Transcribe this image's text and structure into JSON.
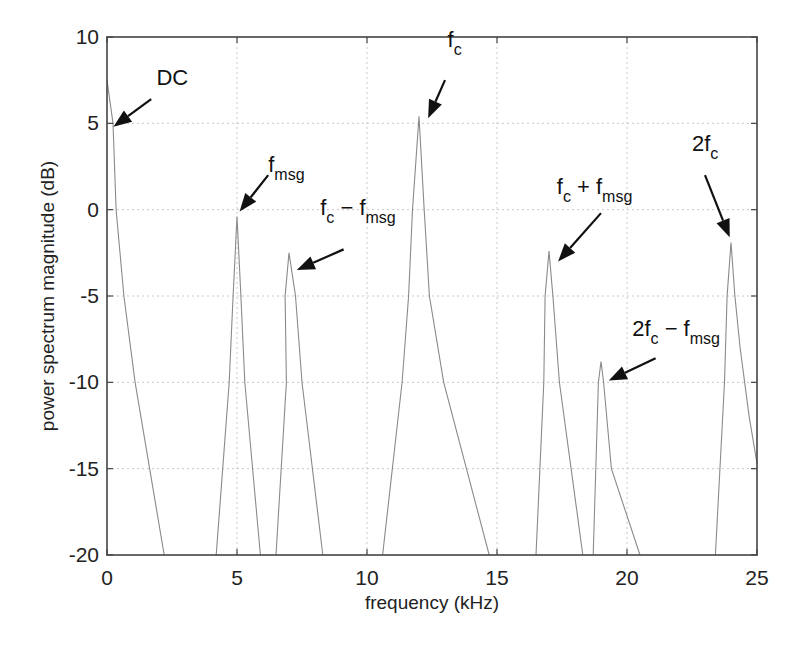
{
  "chart_data": {
    "type": "line",
    "title": "",
    "xlabel": "frequency (kHz)",
    "ylabel": "power spectrum magnitude (dB)",
    "xlim": [
      0,
      25
    ],
    "ylim": [
      -20,
      10
    ],
    "xticks": [
      0,
      5,
      10,
      15,
      20,
      25
    ],
    "yticks": [
      10,
      5,
      0,
      -5,
      -10,
      -15,
      -20
    ],
    "xtick_labels": [
      "0",
      "5",
      "10",
      "15",
      "20",
      "25"
    ],
    "ytick_labels": [
      "10",
      "5",
      "0",
      "-5",
      "-10",
      "-15",
      "-20"
    ],
    "grid": true,
    "legend": null,
    "series": [
      {
        "name": "power spectrum",
        "segments": [
          {
            "label": "DC",
            "x": [
              0.0,
              0.23,
              0.35,
              0.65,
              1.08,
              2.2
            ],
            "y": [
              7.5,
              5.0,
              0.0,
              -5.0,
              -10.0,
              -20.0
            ]
          },
          {
            "label": "f_msg",
            "x": [
              4.2,
              4.7,
              4.85,
              5.0,
              5.15,
              5.3,
              5.9
            ],
            "y": [
              -20.0,
              -10.0,
              -5.0,
              -0.4,
              -5.0,
              -10.0,
              -20.0
            ]
          },
          {
            "label": "f_c - f_msg",
            "x": [
              6.5,
              6.9,
              6.85,
              7.0,
              7.25,
              7.5,
              8.3
            ],
            "y": [
              -20.0,
              -10.0,
              -5.0,
              -2.5,
              -5.0,
              -10.0,
              -20.0
            ]
          },
          {
            "label": "f_c",
            "x": [
              10.6,
              11.35,
              11.6,
              11.75,
              12.0,
              12.2,
              12.4,
              12.95,
              14.7
            ],
            "y": [
              -20.0,
              -10.0,
              -5.0,
              0.0,
              5.4,
              0.0,
              -5.0,
              -10.0,
              -20.0
            ]
          },
          {
            "label": "f_c + f_msg",
            "x": [
              16.5,
              16.8,
              16.85,
              17.0,
              17.15,
              17.4,
              18.3
            ],
            "y": [
              -20.0,
              -10.0,
              -5.0,
              -2.4,
              -5.0,
              -10.0,
              -20.0
            ]
          },
          {
            "label": "2f_c - f_msg",
            "x": [
              18.7,
              18.9,
              19.0,
              19.1,
              19.4,
              20.5
            ],
            "y": [
              -20.0,
              -10.0,
              -8.8,
              -10.0,
              -15.0,
              -20.0
            ]
          },
          {
            "label": "2f_c",
            "x": [
              23.4,
              23.75,
              23.85,
              24.0,
              24.15,
              24.35,
              24.7,
              25.0
            ],
            "y": [
              -20.0,
              -10.0,
              -5.0,
              -1.9,
              -5.0,
              -8.0,
              -12.0,
              -14.7
            ]
          }
        ]
      }
    ],
    "annotations": [
      {
        "id": "dc",
        "text": "DC",
        "sub": "",
        "rest": "",
        "text_x": 1.9,
        "text_y": 7.2,
        "arrow_from": [
          1.7,
          6.4
        ],
        "arrow_to": [
          0.25,
          4.8
        ]
      },
      {
        "id": "fmsg",
        "text": "f",
        "sub": "msg",
        "rest": "",
        "text_x": 6.2,
        "text_y": 2.2,
        "arrow_from": [
          6.2,
          2.0
        ],
        "arrow_to": [
          5.1,
          -0.1
        ]
      },
      {
        "id": "fc-fmsg",
        "text": "f",
        "sub": "c",
        "rest": " − f",
        "sub2": "msg",
        "text_x": 8.2,
        "text_y": -0.3,
        "arrow_from": [
          9.1,
          -2.3
        ],
        "arrow_to": [
          7.3,
          -3.5
        ]
      },
      {
        "id": "fc",
        "text": "f",
        "sub": "c",
        "rest": "",
        "text_x": 13.1,
        "text_y": 9.4,
        "arrow_from": [
          13.0,
          7.5
        ],
        "arrow_to": [
          12.35,
          5.3
        ]
      },
      {
        "id": "fc+fmsg",
        "text": "f",
        "sub": "c",
        "rest": " + f",
        "sub2": "msg",
        "text_x": 17.3,
        "text_y": 0.9,
        "arrow_from": [
          19.0,
          -0.2
        ],
        "arrow_to": [
          17.35,
          -3.0
        ]
      },
      {
        "id": "2fc-fmsg",
        "text": "2f",
        "sub": "c",
        "rest": " − f",
        "sub2": "msg",
        "text_x": 20.2,
        "text_y": -7.3,
        "arrow_from": [
          21.1,
          -8.6
        ],
        "arrow_to": [
          19.3,
          -9.9
        ]
      },
      {
        "id": "2fc",
        "text": "2f",
        "sub": "c",
        "rest": "",
        "text_x": 22.5,
        "text_y": 3.4,
        "arrow_from": [
          23.0,
          2.0
        ],
        "arrow_to": [
          23.95,
          -1.6
        ]
      }
    ]
  }
}
